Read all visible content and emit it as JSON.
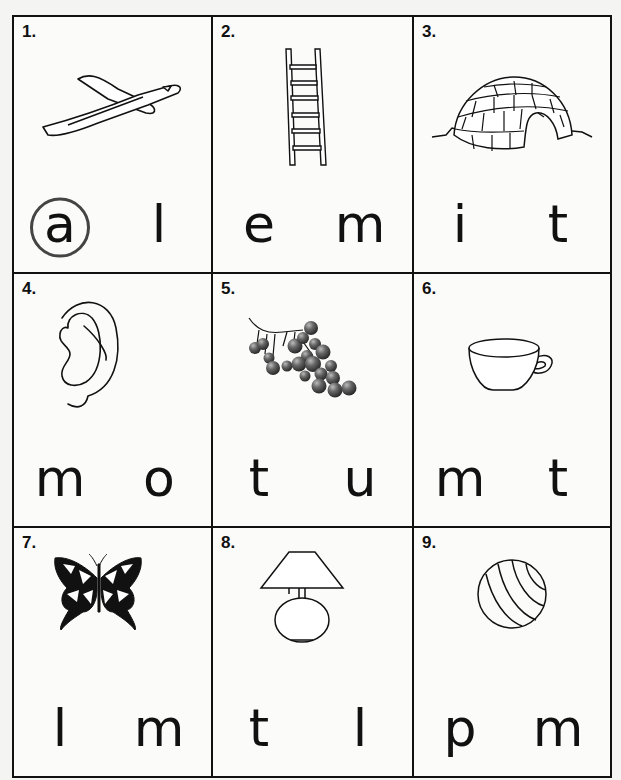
{
  "worksheet": {
    "cells": [
      {
        "number": "1.",
        "picture": "airplane",
        "letters": [
          "a",
          "l"
        ],
        "circled_index": 0
      },
      {
        "number": "2.",
        "picture": "ladder",
        "letters": [
          "e",
          "m"
        ],
        "circled_index": null
      },
      {
        "number": "3.",
        "picture": "igloo",
        "letters": [
          "i",
          "t"
        ],
        "circled_index": null
      },
      {
        "number": "4.",
        "picture": "ear",
        "letters": [
          "m",
          "o"
        ],
        "circled_index": null
      },
      {
        "number": "5.",
        "picture": "berries",
        "letters": [
          "t",
          "u"
        ],
        "circled_index": null
      },
      {
        "number": "6.",
        "picture": "cup",
        "letters": [
          "m",
          "t"
        ],
        "circled_index": null
      },
      {
        "number": "7.",
        "picture": "butterfly",
        "letters": [
          "l",
          "m"
        ],
        "circled_index": null
      },
      {
        "number": "8.",
        "picture": "lamp",
        "letters": [
          "t",
          "l"
        ],
        "circled_index": null
      },
      {
        "number": "9.",
        "picture": "ball",
        "letters": [
          "p",
          "m"
        ],
        "circled_index": null
      }
    ]
  },
  "colors": {
    "ink": "#111111",
    "paper": "#fbfbfa",
    "circle": "#444444",
    "berry": "#555555"
  }
}
